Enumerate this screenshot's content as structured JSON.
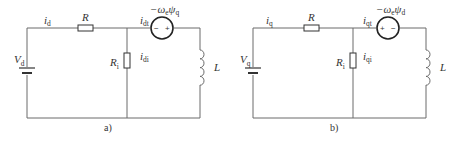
{
  "circuits": [
    {
      "caption": "a)",
      "source_label": "V",
      "source_sub": "d",
      "current_label": "i",
      "current_sub": "d",
      "resistor_label": "R",
      "shunt_label": "R",
      "shunt_sub": "i",
      "shunt_current": "i",
      "shunt_current_sub": "di",
      "branch_current": "i",
      "branch_current_sub": "dt",
      "dep_source_label": "−ω",
      "dep_source_sub1": "e",
      "dep_source_psi": "ψ",
      "dep_source_sub2": "q",
      "dep_left_sign": "−",
      "dep_right_sign": "+",
      "inductor_label": "L"
    },
    {
      "caption": "b)",
      "source_label": "V",
      "source_sub": "q",
      "current_label": "i",
      "current_sub": "q",
      "resistor_label": "R",
      "shunt_label": "R",
      "shunt_sub": "i",
      "shunt_current": "i",
      "shunt_current_sub": "qi",
      "branch_current": "i",
      "branch_current_sub": "qt",
      "dep_source_label": "−ω",
      "dep_source_sub1": "e",
      "dep_source_psi": "ψ",
      "dep_source_sub2": "d",
      "dep_left_sign": "+",
      "dep_right_sign": "−",
      "inductor_label": "L"
    }
  ]
}
